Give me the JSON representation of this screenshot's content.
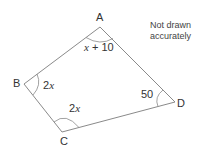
{
  "diagram": {
    "type": "quadrilateral",
    "vertices": {
      "A": {
        "label": "A",
        "x": 100,
        "y": 27
      },
      "B": {
        "label": "B",
        "x": 24,
        "y": 84
      },
      "C": {
        "label": "C",
        "x": 62,
        "y": 132
      },
      "D": {
        "label": "D",
        "x": 175,
        "y": 102
      }
    },
    "angles": {
      "A": {
        "var": "x",
        "rest": " + 10"
      },
      "B": {
        "coef": "2",
        "var": "x"
      },
      "C": {
        "coef": "2",
        "var": "x"
      },
      "D": {
        "value": "50"
      }
    },
    "note": {
      "line1": "Not drawn",
      "line2": "accurately"
    },
    "colors": {
      "stroke": "#8a8a8a",
      "text": "#333333"
    }
  }
}
